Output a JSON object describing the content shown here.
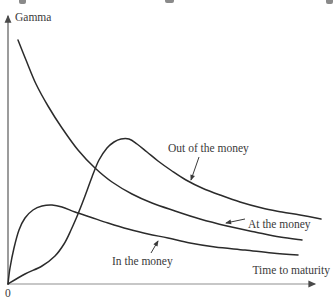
{
  "figure": {
    "background": "#ffffff",
    "text_color": "#3a3a3a",
    "curve_color": "#2b2b2b",
    "x_axis_color": "#8f8f8f",
    "y_axis_color": "#5a5a5a"
  },
  "chart_data": {
    "type": "line",
    "title": "",
    "xlabel": "Time to maturity",
    "ylabel": "Gamma",
    "origin_label": "0",
    "legend_position": "inline-annotations",
    "axes_px": {
      "origin": [
        8,
        284
      ],
      "x_end": [
        315,
        284
      ],
      "y_end": [
        8,
        16
      ]
    },
    "series": [
      {
        "name": "Out of the money",
        "points_px": [
          [
            8,
            284
          ],
          [
            25,
            274
          ],
          [
            42,
            266
          ],
          [
            55,
            256
          ],
          [
            64,
            244
          ],
          [
            71,
            230
          ],
          [
            78,
            214
          ],
          [
            85,
            196
          ],
          [
            92,
            177
          ],
          [
            99,
            160
          ],
          [
            107,
            148
          ],
          [
            114,
            142
          ],
          [
            121,
            139
          ],
          [
            129,
            139
          ],
          [
            137,
            144
          ],
          [
            147,
            152
          ],
          [
            158,
            161
          ],
          [
            172,
            171
          ],
          [
            186,
            180
          ],
          [
            202,
            188
          ],
          [
            220,
            195
          ],
          [
            240,
            202
          ],
          [
            262,
            208
          ],
          [
            282,
            212
          ],
          [
            300,
            215
          ],
          [
            321,
            219
          ]
        ]
      },
      {
        "name": "At the money",
        "points_px": [
          [
            18,
            40
          ],
          [
            26,
            60
          ],
          [
            36,
            84
          ],
          [
            48,
            106
          ],
          [
            62,
            128
          ],
          [
            78,
            150
          ],
          [
            95,
            168
          ],
          [
            112,
            182
          ],
          [
            132,
            194
          ],
          [
            152,
            203
          ],
          [
            175,
            211
          ],
          [
            200,
            219
          ],
          [
            227,
            226
          ],
          [
            255,
            232
          ],
          [
            280,
            237
          ],
          [
            302,
            240
          ]
        ]
      },
      {
        "name": "In the money",
        "points_px": [
          [
            8,
            284
          ],
          [
            10,
            268
          ],
          [
            14,
            248
          ],
          [
            19,
            230
          ],
          [
            25,
            218
          ],
          [
            33,
            210
          ],
          [
            42,
            206
          ],
          [
            52,
            205
          ],
          [
            62,
            207
          ],
          [
            75,
            212
          ],
          [
            90,
            217
          ],
          [
            108,
            223
          ],
          [
            128,
            229
          ],
          [
            148,
            234
          ],
          [
            168,
            238
          ],
          [
            190,
            243
          ],
          [
            215,
            247
          ],
          [
            245,
            250
          ],
          [
            272,
            253
          ],
          [
            298,
            255
          ]
        ]
      }
    ],
    "annotations": [
      {
        "label": "Out of the money",
        "text_x": 168,
        "text_y": 152,
        "anchor": "start",
        "arrow": [
          199,
          157,
          191,
          180
        ]
      },
      {
        "label": "At the money",
        "text_x": 248,
        "text_y": 228,
        "anchor": "start",
        "arrow": [
          245,
          219,
          226,
          223
        ]
      },
      {
        "label": "In the money",
        "text_x": 112,
        "text_y": 265,
        "anchor": "start",
        "arrow": [
          151,
          253,
          158,
          241
        ]
      }
    ]
  }
}
